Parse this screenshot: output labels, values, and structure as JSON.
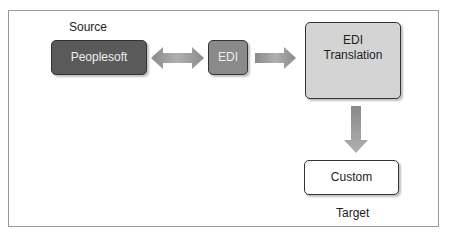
{
  "diagram": {
    "source_label": "Source",
    "target_label": "Target",
    "nodes": {
      "peoplesoft": "Peoplesoft",
      "edi": "EDI",
      "edi_translation": "EDI\nTranslation",
      "custom": "Custom"
    },
    "edges": [
      {
        "from": "peoplesoft",
        "to": "edi",
        "type": "bidirectional"
      },
      {
        "from": "edi",
        "to": "edi_translation",
        "type": "directed"
      },
      {
        "from": "edi_translation",
        "to": "custom",
        "type": "directed"
      }
    ],
    "colors": {
      "peoplesoft_fill": "#5a5a5a",
      "edi_fill": "#8a8a8a",
      "translation_fill": "#d4d4d4",
      "custom_fill": "#ffffff",
      "arrow_fill": "#9a9a9a"
    }
  }
}
